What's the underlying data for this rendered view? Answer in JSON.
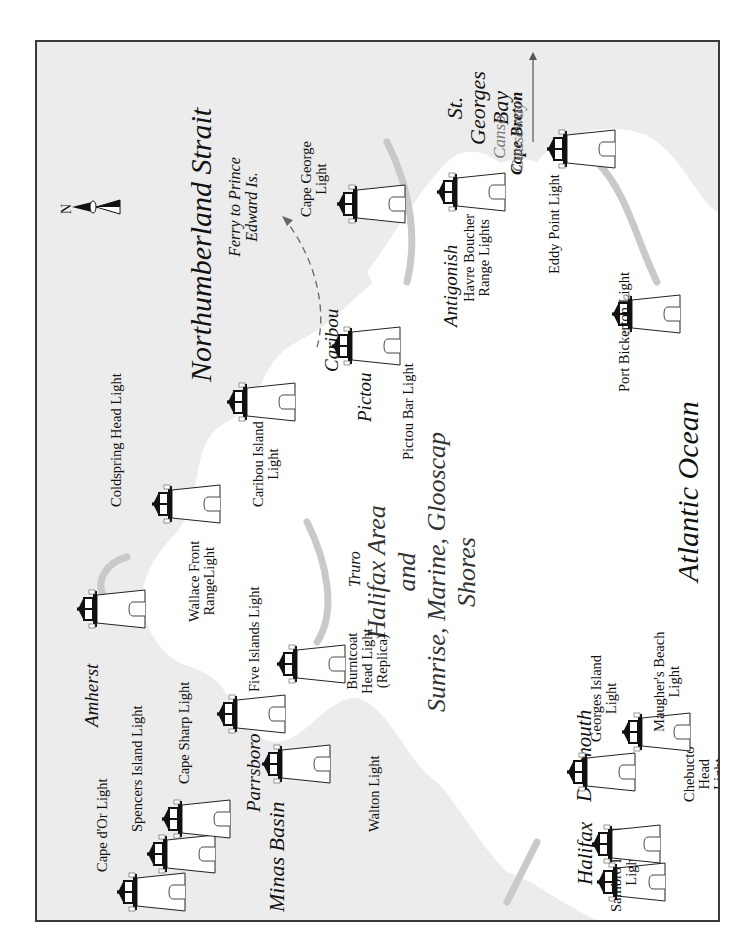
{
  "map": {
    "title_lines": [
      "Halifax Area",
      "and",
      "Sunrise, Marine, Glooscap",
      "Shores"
    ],
    "orientation": "rotated 90 degrees counter-clockwise (north points left)",
    "compass": {
      "label": "N"
    },
    "water_bodies": {
      "northumberland": "Northumberland Strait",
      "atlantic": "Atlantic Ocean",
      "st_georges": "St. Georges Bay",
      "minas": "Minas Basin"
    },
    "ferry": {
      "label": "Ferry to Prince Edward Is."
    },
    "cape_breton": {
      "label": "Cape Breton"
    },
    "canso": {
      "label": "Canso Causeway"
    },
    "places": {
      "amherst": "Amherst",
      "truro": "Truro",
      "pictou": "Pictou",
      "caribou": "Caribou",
      "antigonish": "Antigonish",
      "parrsboro": "Parrsboro",
      "halifax": "Halifax",
      "dartmouth": "Dartmouth"
    },
    "lighthouses": {
      "cape_dor": "Cape d'Or Light",
      "spencers": "Spencers Island Light",
      "cape_sharp": "Cape Sharp Light",
      "five_islands": "Five Islands Light",
      "burntcoat": "Burntcoat\nHead Light\n(Replica)",
      "walton": "Walton Light",
      "coldspring": "Coldspring Head Light",
      "wallace": "Wallace Front\nRangeLight",
      "caribou_island": "Caribou Island\nLight",
      "pictou_bar": "Pictou Bar Light",
      "cape_george": "Cape George\nLight",
      "havre_boucher": "Havre Boucher\nRange Lights",
      "eddy_point": "Eddy Point Light",
      "port_bickerton": "Port Bickerton Light",
      "sambro": "Sambro Island\nLight",
      "chebucto": "Chebucto\nHead\nLight",
      "georges_island": "Georges Island\nLight",
      "maughers": "Maugher's Beach\nLight"
    },
    "colors": {
      "sea": "#ececec",
      "land": "#ffffff",
      "coast": "#c9c9c9",
      "frame": "#3a3a3a",
      "ink": "#111111"
    }
  }
}
